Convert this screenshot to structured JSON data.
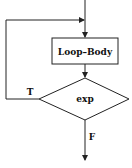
{
  "diagram": {
    "type": "flowchart",
    "nodes": [
      {
        "id": "body",
        "shape": "rectangle",
        "label": "Loop–Body"
      },
      {
        "id": "cond",
        "shape": "diamond",
        "label": "exp"
      }
    ],
    "edges": [
      {
        "from": "entry",
        "to": "body",
        "label": ""
      },
      {
        "from": "body",
        "to": "cond",
        "label": ""
      },
      {
        "from": "cond",
        "to": "body",
        "label": "T"
      },
      {
        "from": "cond",
        "to": "exit",
        "label": "F"
      }
    ],
    "labels": {
      "true_branch": "T",
      "false_branch": "F"
    },
    "colors": {
      "stroke": "#222222",
      "background": "#ffffff"
    }
  }
}
